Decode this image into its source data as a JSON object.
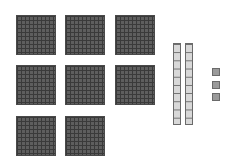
{
  "diagram": {
    "type": "base-ten blocks",
    "hundreds_flats": 8,
    "tens_rods": 2,
    "ones_units": 3,
    "represented_value": 823,
    "colors": {
      "flat": "#5e5e5e",
      "rod": "#d8d8d8",
      "unit": "#9a9a9a",
      "outline": "#4a4a4a"
    }
  }
}
